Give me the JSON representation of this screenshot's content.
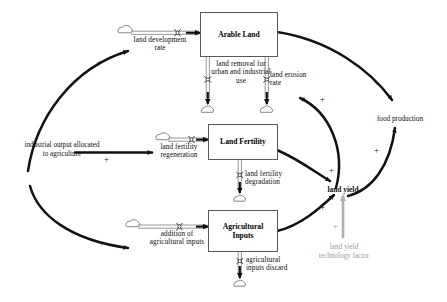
{
  "diagram": {
    "colors": {
      "stroke": "#111111",
      "flow_pipe": "#8a8a8a",
      "stock_border": "#5a5a5a",
      "exogenous_gray": "#a0a0a0",
      "background": "#ffffff"
    }
  },
  "stocks": [
    {
      "id": "arable_land",
      "label": "Arable Land"
    },
    {
      "id": "land_fertility",
      "label": "Land Fertility"
    },
    {
      "id": "agricultural_inputs",
      "label": "Agricultural\nInputs"
    }
  ],
  "flows": [
    {
      "id": "land_development_rate",
      "label": "land development\nrate",
      "direction": "inflow",
      "target": "arable_land"
    },
    {
      "id": "land_removal",
      "label": "land removal for\nurban and industrial\nuse",
      "direction": "outflow",
      "source": "arable_land"
    },
    {
      "id": "land_erosion_rate",
      "label": "land erosion\nrate",
      "direction": "outflow",
      "source": "arable_land"
    },
    {
      "id": "land_fertility_regeneration",
      "label": "land fertility\nregeneration",
      "direction": "inflow",
      "target": "land_fertility"
    },
    {
      "id": "land_fertility_degradation",
      "label": "land fertility\ndegradation",
      "direction": "outflow",
      "source": "land_fertility"
    },
    {
      "id": "addition_of_agricultural_inputs",
      "label": "addition of\nagricultural inputs",
      "direction": "inflow",
      "target": "agricultural_inputs"
    },
    {
      "id": "agricultural_inputs_discard",
      "label": "agricultural\ninputs discard",
      "direction": "outflow",
      "source": "agricultural_inputs"
    }
  ],
  "variables": [
    {
      "id": "industrial_output",
      "label": "industrial output allocated\nto agriculture",
      "style": "plain"
    },
    {
      "id": "land_yield",
      "label": "land yield",
      "style": "bold"
    },
    {
      "id": "food_production",
      "label": "food production",
      "style": "plain"
    },
    {
      "id": "land_yield_technology_factor",
      "label": "land yield\ntechnology factor",
      "style": "gray"
    }
  ],
  "links": [
    {
      "id": "io-to-ldr",
      "from": "industrial_output",
      "to": "land_development_rate",
      "polarity": "+"
    },
    {
      "id": "io-to-lfr",
      "from": "industrial_output",
      "to": "land_fertility_regeneration",
      "polarity": "+"
    },
    {
      "id": "io-to-aai",
      "from": "industrial_output",
      "to": "addition_of_agricultural_inputs",
      "polarity": "+"
    },
    {
      "id": "arable-to-food",
      "from": "arable_land",
      "to": "food_production",
      "polarity": "+"
    },
    {
      "id": "fertility-to-yield",
      "from": "land_fertility",
      "to": "land_yield",
      "polarity": "+"
    },
    {
      "id": "inputs-to-yield",
      "from": "agricultural_inputs",
      "to": "land_yield",
      "polarity": "+"
    },
    {
      "id": "yield-to-erosion",
      "from": "land_yield",
      "to": "land_erosion_rate",
      "polarity": "+"
    },
    {
      "id": "yield-to-food",
      "from": "land_yield",
      "to": "food_production",
      "polarity": "+"
    },
    {
      "id": "tech-to-yield",
      "from": "land_yield_technology_factor",
      "to": "land_yield",
      "polarity": "+",
      "style": "gray"
    }
  ],
  "signs": {
    "plus": "+"
  }
}
